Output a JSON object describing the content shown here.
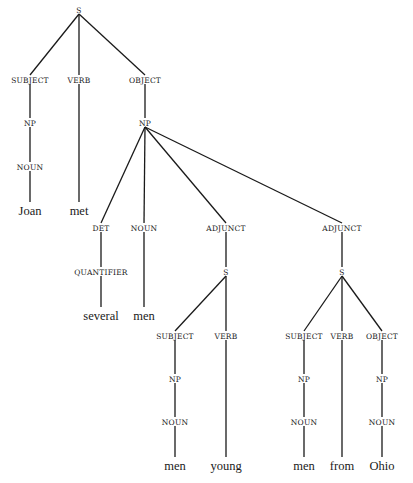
{
  "diagram": {
    "type": "parse-tree",
    "nodes": [
      {
        "id": "s0",
        "label": "S",
        "x": 79,
        "y": 10,
        "kind": "cat"
      },
      {
        "id": "subj0",
        "label": "SUBJECT",
        "x": 30,
        "y": 80,
        "kind": "cat"
      },
      {
        "id": "verb0",
        "label": "VERB",
        "x": 79,
        "y": 80,
        "kind": "cat"
      },
      {
        "id": "obj0",
        "label": "OBJECT",
        "x": 145,
        "y": 80,
        "kind": "cat"
      },
      {
        "id": "np0",
        "label": "NP",
        "x": 30,
        "y": 123,
        "kind": "cat"
      },
      {
        "id": "np1",
        "label": "NP",
        "x": 145,
        "y": 123,
        "kind": "cat"
      },
      {
        "id": "noun0",
        "label": "NOUN",
        "x": 30,
        "y": 167,
        "kind": "cat"
      },
      {
        "id": "w_joan",
        "label": "Joan",
        "x": 30,
        "y": 211,
        "kind": "word"
      },
      {
        "id": "w_met",
        "label": "met",
        "x": 79,
        "y": 211,
        "kind": "word"
      },
      {
        "id": "det0",
        "label": "DET",
        "x": 101,
        "y": 228,
        "kind": "cat"
      },
      {
        "id": "noun1",
        "label": "NOUN",
        "x": 144,
        "y": 228,
        "kind": "cat"
      },
      {
        "id": "adj0",
        "label": "ADJUNCT",
        "x": 226,
        "y": 228,
        "kind": "cat"
      },
      {
        "id": "adj1",
        "label": "ADJUNCT",
        "x": 342,
        "y": 228,
        "kind": "cat"
      },
      {
        "id": "quant0",
        "label": "QUANTIFIER",
        "x": 101,
        "y": 272,
        "kind": "cat"
      },
      {
        "id": "s1",
        "label": "S",
        "x": 226,
        "y": 272,
        "kind": "cat"
      },
      {
        "id": "s2",
        "label": "S",
        "x": 342,
        "y": 272,
        "kind": "cat"
      },
      {
        "id": "w_several",
        "label": "several",
        "x": 101,
        "y": 316,
        "kind": "word"
      },
      {
        "id": "w_men0",
        "label": "men",
        "x": 144,
        "y": 316,
        "kind": "word"
      },
      {
        "id": "subj1",
        "label": "SUBJECT",
        "x": 175,
        "y": 336,
        "kind": "cat"
      },
      {
        "id": "verb1",
        "label": "VERB",
        "x": 226,
        "y": 336,
        "kind": "cat"
      },
      {
        "id": "subj2",
        "label": "SUBJECT",
        "x": 304,
        "y": 336,
        "kind": "cat"
      },
      {
        "id": "verb2",
        "label": "VERB",
        "x": 342,
        "y": 336,
        "kind": "cat"
      },
      {
        "id": "obj2",
        "label": "OBJECT",
        "x": 382,
        "y": 336,
        "kind": "cat"
      },
      {
        "id": "np2",
        "label": "NP",
        "x": 175,
        "y": 379,
        "kind": "cat"
      },
      {
        "id": "np3",
        "label": "NP",
        "x": 304,
        "y": 379,
        "kind": "cat"
      },
      {
        "id": "np4",
        "label": "NP",
        "x": 382,
        "y": 379,
        "kind": "cat"
      },
      {
        "id": "noun2",
        "label": "NOUN",
        "x": 175,
        "y": 422,
        "kind": "cat"
      },
      {
        "id": "noun3",
        "label": "NOUN",
        "x": 304,
        "y": 422,
        "kind": "cat"
      },
      {
        "id": "noun4",
        "label": "NOUN",
        "x": 382,
        "y": 422,
        "kind": "cat"
      },
      {
        "id": "w_men1",
        "label": "men",
        "x": 175,
        "y": 466,
        "kind": "word"
      },
      {
        "id": "w_young",
        "label": "young",
        "x": 226,
        "y": 466,
        "kind": "word"
      },
      {
        "id": "w_men2",
        "label": "men",
        "x": 304,
        "y": 466,
        "kind": "word"
      },
      {
        "id": "w_from",
        "label": "from",
        "x": 342,
        "y": 466,
        "kind": "word"
      },
      {
        "id": "w_ohio",
        "label": "Ohio",
        "x": 382,
        "y": 466,
        "kind": "word"
      }
    ],
    "edges": [
      [
        "s0",
        "subj0"
      ],
      [
        "s0",
        "verb0"
      ],
      [
        "s0",
        "obj0"
      ],
      [
        "subj0",
        "np0"
      ],
      [
        "np0",
        "noun0"
      ],
      [
        "noun0",
        "w_joan"
      ],
      [
        "verb0",
        "w_met"
      ],
      [
        "obj0",
        "np1"
      ],
      [
        "np1",
        "det0"
      ],
      [
        "np1",
        "noun1"
      ],
      [
        "np1",
        "adj0"
      ],
      [
        "np1",
        "adj1"
      ],
      [
        "det0",
        "quant0"
      ],
      [
        "quant0",
        "w_several"
      ],
      [
        "noun1",
        "w_men0"
      ],
      [
        "adj0",
        "s1"
      ],
      [
        "s1",
        "subj1"
      ],
      [
        "s1",
        "verb1"
      ],
      [
        "subj1",
        "np2"
      ],
      [
        "np2",
        "noun2"
      ],
      [
        "noun2",
        "w_men1"
      ],
      [
        "verb1",
        "w_young"
      ],
      [
        "adj1",
        "s2"
      ],
      [
        "s2",
        "subj2"
      ],
      [
        "s2",
        "verb2"
      ],
      [
        "s2",
        "obj2"
      ],
      [
        "subj2",
        "np3"
      ],
      [
        "np3",
        "noun3"
      ],
      [
        "noun3",
        "w_men2"
      ],
      [
        "verb2",
        "w_from"
      ],
      [
        "obj2",
        "np4"
      ],
      [
        "np4",
        "noun4"
      ],
      [
        "noun4",
        "w_ohio"
      ]
    ],
    "sentence": [
      "Joan",
      "met",
      "several",
      "men",
      "men",
      "young",
      "men",
      "from",
      "Ohio"
    ],
    "colors": {
      "line": "#1a1a1a",
      "text": "#1a1a1a",
      "background": "#ffffff"
    }
  }
}
